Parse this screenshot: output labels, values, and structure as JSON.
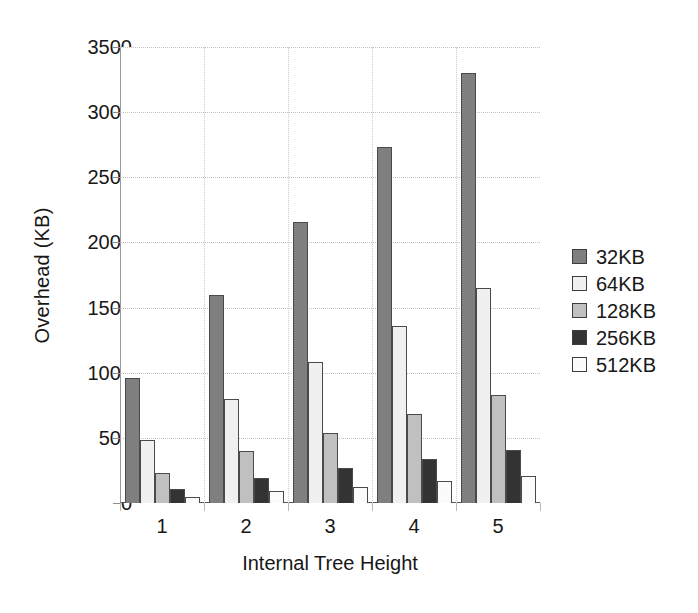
{
  "chart_data": {
    "type": "bar",
    "title": "",
    "xlabel": "Internal Tree Height",
    "ylabel": "Overhead (KB)",
    "categories": [
      "1",
      "2",
      "3",
      "4",
      "5"
    ],
    "ylim": [
      0,
      3500
    ],
    "ytick_labels": [
      "0",
      "500",
      "1000",
      "1500",
      "2000",
      "2500",
      "3000",
      "3500"
    ],
    "yticks": [
      0,
      500,
      1000,
      1500,
      2000,
      2500,
      3000,
      3500
    ],
    "grid": true,
    "legend_position": "right",
    "series": [
      {
        "name": "32KB",
        "color": "#7f7f7f",
        "values": [
          960,
          1600,
          2160,
          2730,
          3300
        ]
      },
      {
        "name": "64KB",
        "color": "#f0f0f0",
        "values": [
          480,
          800,
          1080,
          1360,
          1650
        ]
      },
      {
        "name": "128KB",
        "color": "#c0c0c0",
        "values": [
          230,
          400,
          540,
          680,
          830
        ]
      },
      {
        "name": "256KB",
        "color": "#333333",
        "values": [
          110,
          195,
          265,
          335,
          410
        ]
      },
      {
        "name": "512KB",
        "color": "#fbfbfb",
        "values": [
          45,
          95,
          125,
          170,
          205
        ]
      }
    ]
  },
  "legend": {
    "items": [
      {
        "label": "32KB",
        "color": "#7f7f7f"
      },
      {
        "label": "64KB",
        "color": "#f0f0f0"
      },
      {
        "label": "128KB",
        "color": "#c0c0c0"
      },
      {
        "label": "256KB",
        "color": "#333333"
      },
      {
        "label": "512KB",
        "color": "#fbfbfb"
      }
    ]
  }
}
